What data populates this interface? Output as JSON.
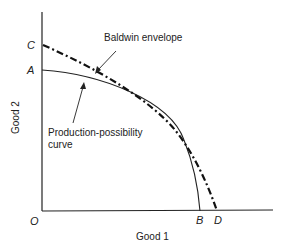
{
  "diagram": {
    "axes": {
      "y_label": "Good 2",
      "x_label": "Good 1",
      "origin": "O"
    },
    "points": {
      "C": "C",
      "A": "A",
      "B": "B",
      "D": "D"
    },
    "annotations": {
      "envelope": "Baldwin envelope",
      "ppc_line1": "Production-possibility",
      "ppc_line2": "curve"
    },
    "curves": [
      {
        "name": "Production-possibility curve",
        "from": "A",
        "to": "B",
        "style": "solid"
      },
      {
        "name": "Baldwin envelope",
        "from": "C",
        "to": "D",
        "style": "dash-dot"
      }
    ]
  }
}
